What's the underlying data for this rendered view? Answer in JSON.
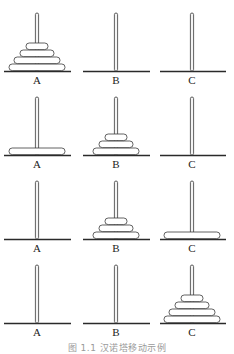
{
  "figure": {
    "caption": "图 1.1  汉诺塔移动示例",
    "colors": {
      "stroke": "#3a3a3a",
      "disc_fill": "#ffffff",
      "peg_fill": "#f4f4f4",
      "base": "#2a2a2a",
      "label": "#222222"
    },
    "pegs": [
      {
        "label": "A",
        "x": 37,
        "base_left": 4,
        "base_right": 71
      },
      {
        "label": "B",
        "x": 116,
        "base_left": 83,
        "base_right": 150
      },
      {
        "label": "C",
        "x": 192,
        "base_left": 160,
        "base_right": 226
      }
    ],
    "disc_widths": {
      "1": 22,
      "2": 34,
      "3": 46,
      "4": 56
    },
    "disc_height": 7,
    "steps": [
      {
        "baseline": 71,
        "label_y": 84,
        "peg_top": 13,
        "stacks": {
          "A": [
            4,
            3,
            2,
            1
          ],
          "B": [],
          "C": []
        }
      },
      {
        "baseline": 155,
        "label_y": 168,
        "peg_top": 97,
        "stacks": {
          "A": [
            4
          ],
          "B": [
            3,
            2,
            1
          ],
          "C": []
        }
      },
      {
        "baseline": 239,
        "label_y": 252,
        "peg_top": 181,
        "stacks": {
          "A": [],
          "B": [
            3,
            2,
            1
          ],
          "C": [
            4
          ]
        }
      },
      {
        "baseline": 323,
        "label_y": 336,
        "peg_top": 265,
        "stacks": {
          "A": [],
          "B": [],
          "C": [
            4,
            3,
            2,
            1
          ]
        }
      }
    ]
  }
}
